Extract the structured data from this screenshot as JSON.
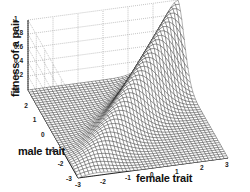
{
  "chart_data": {
    "type": "surface",
    "title": "",
    "xlabel": "female trait",
    "ylabel": "male trait",
    "zlabel": "fitness of a pair",
    "x_ticks": [
      "-3",
      "-2",
      "-1",
      "0",
      "1",
      "2",
      "3"
    ],
    "y_ticks": [
      "-3",
      "-2",
      "-1",
      "0",
      "1",
      "2",
      "3"
    ],
    "z_ticks": [
      "0",
      "0.2",
      "0.4",
      "0.6",
      "0.8",
      "1"
    ],
    "xlim": [
      -3,
      3
    ],
    "ylim": [
      -3,
      3
    ],
    "zlim": [
      0,
      1
    ],
    "grid": true,
    "ridge_profile": {
      "trait_value": [
        -3,
        -2,
        -1,
        0,
        1,
        2,
        3
      ],
      "fitness_on_diagonal": [
        0.0,
        0.17,
        0.33,
        0.5,
        0.67,
        0.83,
        1.0
      ]
    }
  },
  "labels": {
    "z_axis": "fitness of a pair",
    "y_axis": "male trait",
    "x_axis": "female trait"
  },
  "ticks": {
    "z": [
      "0",
      "0.2",
      "0.4",
      "0.6",
      "0.8",
      "1"
    ],
    "y": [
      "-3",
      "-2",
      "-1",
      "0",
      "1",
      "2",
      "3"
    ],
    "x": [
      "-3",
      "-2",
      "-1",
      "0",
      "1",
      "2",
      "3"
    ]
  }
}
